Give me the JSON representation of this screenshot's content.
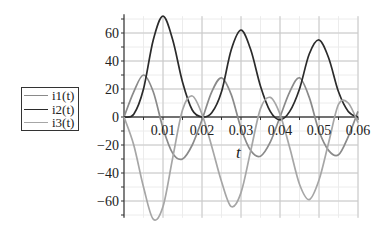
{
  "chart_data": {
    "type": "line",
    "title": "",
    "xlabel": "t",
    "ylabel": "",
    "xlim": [
      0,
      0.06
    ],
    "ylim": [
      -72,
      72
    ],
    "x_ticks": [
      "0.01",
      "0.02",
      "0.03",
      "0.04",
      "0.05",
      "0.06"
    ],
    "y_ticks": [
      "60",
      "40",
      "20",
      "0",
      "-20",
      "-40",
      "-60"
    ],
    "grid": true,
    "legend_position": "left",
    "series": [
      {
        "name": "i1(t)",
        "color": "#8a8a8a",
        "x": [
          0,
          0.0025,
          0.005,
          0.0075,
          0.01,
          0.0125,
          0.015,
          0.0175,
          0.02,
          0.0225,
          0.025,
          0.0275,
          0.03,
          0.0325,
          0.035,
          0.0375,
          0.04,
          0.0425,
          0.045,
          0.0475,
          0.05,
          0.0525,
          0.055,
          0.0575,
          0.06
        ],
        "values": [
          0,
          18,
          30,
          18,
          -8,
          -26,
          -30,
          -20,
          -2,
          18,
          28,
          16,
          -8,
          -24,
          -28,
          -18,
          0,
          18,
          28,
          14,
          -10,
          -24,
          -27,
          -14,
          4
        ]
      },
      {
        "name": "i2(t)",
        "color": "#2b2b2b",
        "x": [
          0,
          0.0025,
          0.005,
          0.0075,
          0.01,
          0.0125,
          0.015,
          0.0175,
          0.02,
          0.0225,
          0.025,
          0.0275,
          0.03,
          0.0325,
          0.035,
          0.0375,
          0.04,
          0.0425,
          0.045,
          0.0475,
          0.05,
          0.0525,
          0.055,
          0.0575,
          0.06
        ],
        "values": [
          0,
          2,
          20,
          55,
          72,
          55,
          25,
          5,
          0,
          3,
          18,
          48,
          62,
          48,
          22,
          4,
          -2,
          4,
          20,
          45,
          55,
          42,
          18,
          4,
          0
        ]
      },
      {
        "name": "i3(t)",
        "color": "#a6a6a6",
        "x": [
          0,
          0.0025,
          0.005,
          0.0075,
          0.01,
          0.0125,
          0.015,
          0.0175,
          0.02,
          0.0225,
          0.025,
          0.0275,
          0.03,
          0.0325,
          0.035,
          0.0375,
          0.04,
          0.0425,
          0.045,
          0.0475,
          0.05,
          0.0525,
          0.055,
          0.0575,
          0.06
        ],
        "values": [
          0,
          -20,
          -50,
          -73,
          -64,
          -29,
          5,
          15,
          2,
          -21,
          -46,
          -64,
          -54,
          -24,
          6,
          14,
          2,
          -22,
          -48,
          -59,
          -45,
          -18,
          9,
          10,
          -4
        ]
      }
    ]
  },
  "legend": {
    "items": [
      {
        "label": "i1(t)"
      },
      {
        "label": "i2(t)"
      },
      {
        "label": "i3(t)"
      }
    ]
  },
  "axis": {
    "x_label": "t"
  }
}
